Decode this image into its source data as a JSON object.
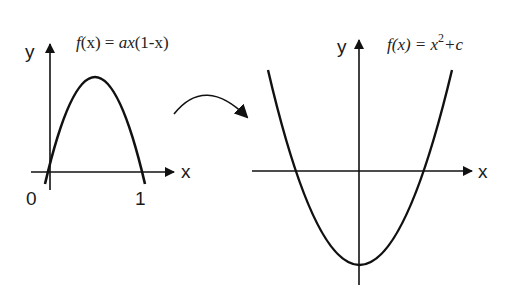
{
  "left_plot": {
    "formula": {
      "fn": "f",
      "arg": "(x) = ",
      "a": "ax",
      "rest": "(1-x)"
    },
    "formula_text": "f(x) = ax(1-x)",
    "y_axis_label": "y",
    "x_axis_label": "x",
    "tick_labels": [
      "0",
      "1"
    ],
    "curve": "downward parabola with roots at 0 and 1"
  },
  "transition_arrow": {
    "direction": "left-to-right",
    "shape": "curved arc"
  },
  "right_plot": {
    "formula_text": "f(x) = x²+c",
    "formula": {
      "fn": "f(x) = x",
      "exp": "2",
      "rest": "+c"
    },
    "y_axis_label": "y",
    "x_axis_label": "x",
    "curve": "upward parabola with vertex below x-axis on the y-axis"
  },
  "colors": {
    "line": "#111111",
    "background": "#ffffff"
  }
}
